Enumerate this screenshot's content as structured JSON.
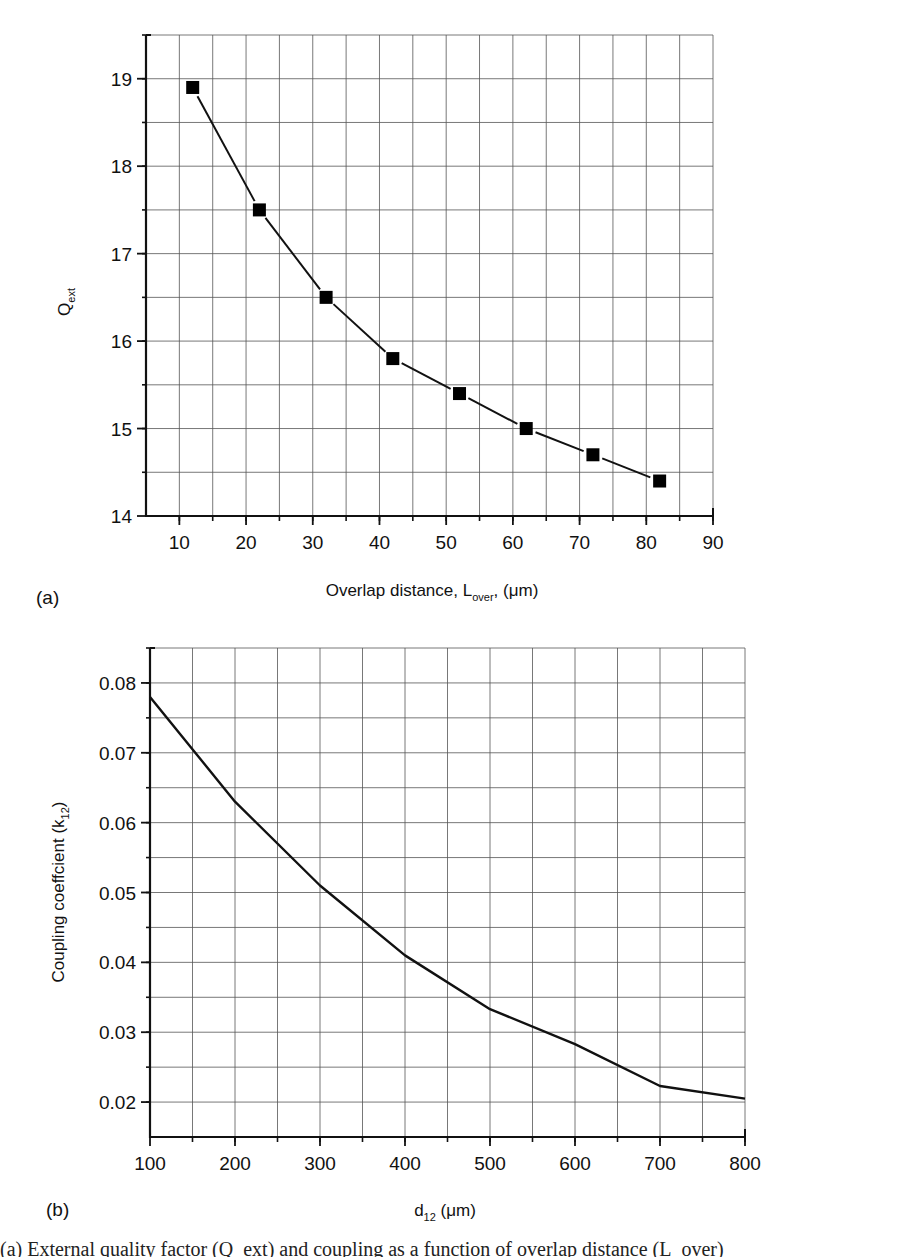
{
  "chart_data": [
    {
      "id": "a",
      "type": "line",
      "panel_label": "(a)",
      "title": "",
      "xlabel": "Overlap distance, L_over, (μm)",
      "xlabel_parts": {
        "main": "Overlap distance, L",
        "sub": "over",
        "tail": ", (μm)"
      },
      "ylabel": "Q_ext",
      "ylabel_parts": {
        "main": "Q",
        "sub": "ext"
      },
      "xlim": [
        5,
        90
      ],
      "ylim": [
        14,
        19.5
      ],
      "xticks": [
        10,
        20,
        30,
        40,
        50,
        60,
        70,
        80,
        90
      ],
      "yticks": [
        14,
        15,
        16,
        17,
        18,
        19
      ],
      "grid": true,
      "marker": "square",
      "series": [
        {
          "name": "Q_ext",
          "x": [
            12,
            22,
            32,
            42,
            52,
            62,
            72,
            82
          ],
          "values": [
            18.9,
            17.5,
            16.5,
            15.8,
            15.4,
            15.0,
            14.7,
            14.4
          ]
        }
      ]
    },
    {
      "id": "b",
      "type": "line",
      "panel_label": "(b)",
      "title": "",
      "xlabel": "d_12 (μm)",
      "xlabel_parts": {
        "main": "d",
        "sub": "12",
        "tail": " (μm)"
      },
      "ylabel": "Coupling coeffcient (k_12)",
      "ylabel_parts": {
        "main": "Coupling coeffcient (k",
        "sub": "12",
        "tail": ")"
      },
      "xlim": [
        100,
        800
      ],
      "ylim": [
        0.015,
        0.085
      ],
      "xticks": [
        100,
        200,
        300,
        400,
        500,
        600,
        700,
        800
      ],
      "yticks": [
        0.02,
        0.03,
        0.04,
        0.05,
        0.06,
        0.07,
        0.08
      ],
      "grid": true,
      "marker": "none",
      "series": [
        {
          "name": "k_12",
          "x": [
            100,
            200,
            300,
            400,
            500,
            600,
            700,
            800
          ],
          "values": [
            0.078,
            0.063,
            0.051,
            0.041,
            0.0333,
            0.0283,
            0.0223,
            0.0205
          ]
        }
      ]
    }
  ],
  "caption": {
    "text": "(a) External quality factor (Q_ext) and coupling as a function of overlap distance (L_over)"
  }
}
